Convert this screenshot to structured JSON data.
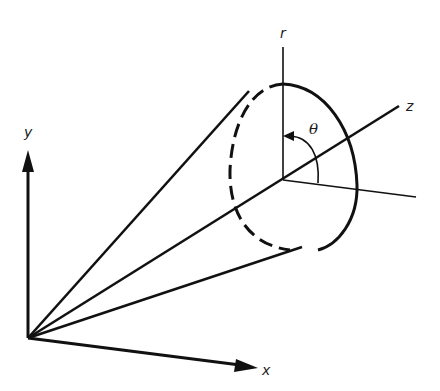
{
  "diagram": {
    "colors": {
      "ink": "#111111",
      "background": "#ffffff"
    },
    "labels": {
      "y_axis": "y",
      "x_axis": "x",
      "z_axis": "z",
      "r_axis": "r",
      "theta": "θ"
    },
    "geometry": {
      "origin": [
        28,
        338
      ],
      "y_axis_tip": [
        28,
        150
      ],
      "x_axis_tip": [
        258,
        368
      ],
      "z_axis_end": [
        399,
        106
      ],
      "section_center": [
        283,
        180
      ],
      "r_axis_top": [
        283,
        47
      ],
      "reference_line_end": [
        416,
        197
      ],
      "cone_lines_to": [
        [
          248,
          92
        ],
        [
          300,
          248
        ]
      ]
    }
  }
}
